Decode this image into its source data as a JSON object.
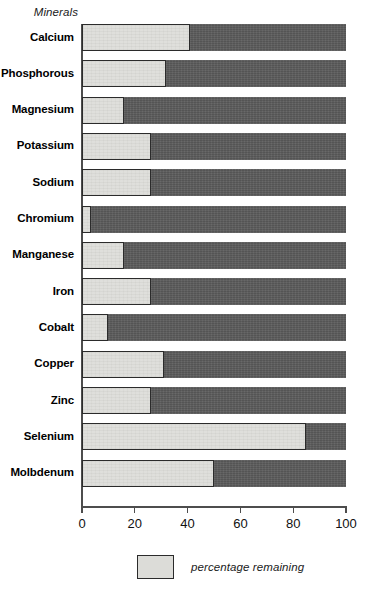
{
  "axis_title": "Minerals",
  "legend": {
    "label": "percentage remaining",
    "swatch_color": "#dcdcd8"
  },
  "colors": {
    "remaining": "#dcdcd8",
    "depleted": "#5c5c5c",
    "outline": "#2b2b2b",
    "axis": "#4d4d4d"
  },
  "chart_data": {
    "type": "bar",
    "orientation": "horizontal",
    "stacked": true,
    "title": "",
    "subtitle": "",
    "xlabel": "",
    "ylabel": "Minerals",
    "xlim": [
      0,
      100
    ],
    "xticks": [
      0,
      20,
      40,
      60,
      80,
      100
    ],
    "xtick_labels": [
      "0",
      "20",
      "40",
      "60",
      "80",
      "100"
    ],
    "grid": false,
    "legend_position": "bottom-center",
    "legend_entries": [
      "percentage remaining"
    ],
    "categories": [
      "Calcium",
      "Phosphorous",
      "Magnesium",
      "Potassium",
      "Sodium",
      "Chromium",
      "Manganese",
      "Iron",
      "Cobalt",
      "Copper",
      "Zinc",
      "Selenium",
      "Molbdenum"
    ],
    "series": [
      {
        "name": "percentage remaining",
        "values": [
          41,
          32,
          16,
          26,
          26,
          3.5,
          16,
          26,
          10,
          31,
          26,
          85,
          50
        ]
      },
      {
        "name": "depleted",
        "values": [
          59,
          68,
          84,
          74,
          74,
          96.5,
          84,
          74,
          90,
          69,
          74,
          15,
          50
        ]
      }
    ]
  }
}
